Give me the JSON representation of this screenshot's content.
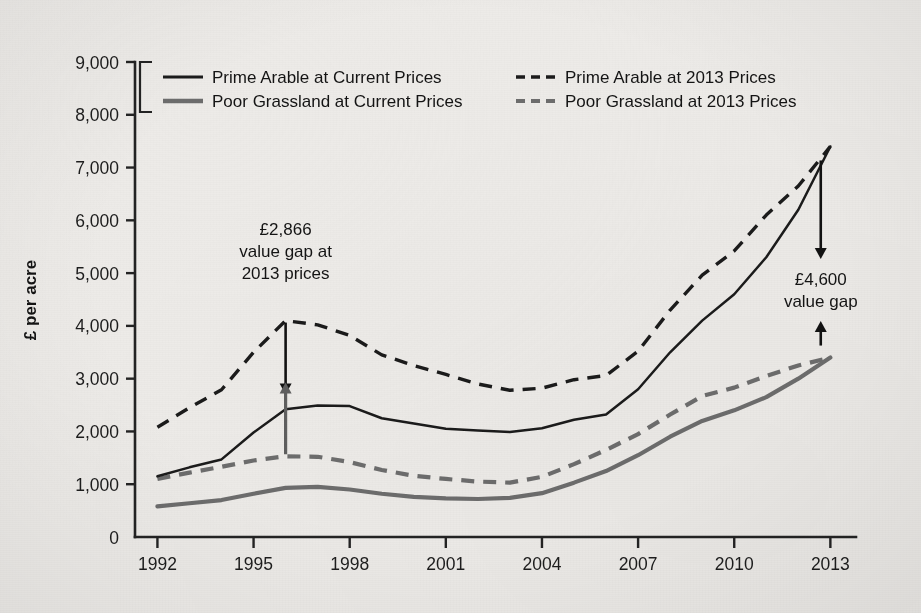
{
  "chart_data": {
    "type": "line",
    "title": "",
    "xlabel": "",
    "ylabel": "£ per acre",
    "xlim": [
      1991.3,
      2013.8
    ],
    "ylim": [
      0,
      9000
    ],
    "grid": false,
    "legend_position": "top-inside",
    "y_ticks": [
      "0",
      "1,000",
      "2,000",
      "3,000",
      "4,000",
      "5,000",
      "6,000",
      "7,000",
      "8,000",
      "9,000"
    ],
    "y_tick_values": [
      0,
      1000,
      2000,
      3000,
      4000,
      5000,
      6000,
      7000,
      8000,
      9000
    ],
    "x_ticks": [
      "1992",
      "1995",
      "1998",
      "2001",
      "2004",
      "2007",
      "2010",
      "2013"
    ],
    "x_tick_values": [
      1992,
      1995,
      1998,
      2001,
      2004,
      2007,
      2010,
      2013
    ],
    "x": [
      1992,
      1993,
      1994,
      1995,
      1996,
      1997,
      1998,
      1999,
      2000,
      2001,
      2002,
      2003,
      2004,
      2005,
      2006,
      2007,
      2008,
      2009,
      2010,
      2011,
      2012,
      2013
    ],
    "series": [
      {
        "name": "Prime Arable at Current Prices",
        "style": "solid",
        "color": "#1b1b1b",
        "values": [
          1150,
          1320,
          1470,
          1980,
          2420,
          2490,
          2480,
          2250,
          2150,
          2050,
          2020,
          1990,
          2060,
          2220,
          2320,
          2800,
          3500,
          4100,
          4600,
          5300,
          6200,
          7400
        ]
      },
      {
        "name": "Poor Grassland at Current Prices",
        "style": "solid",
        "color": "#6d6d6d",
        "values": [
          580,
          640,
          700,
          820,
          930,
          950,
          900,
          820,
          760,
          730,
          720,
          740,
          830,
          1030,
          1250,
          1550,
          1900,
          2200,
          2400,
          2650,
          3000,
          3400
        ]
      },
      {
        "name": "Prime Arable at 2013 Prices",
        "style": "dashed",
        "color": "#1b1b1b",
        "values": [
          2080,
          2450,
          2790,
          3500,
          4100,
          4020,
          3820,
          3450,
          3250,
          3080,
          2900,
          2780,
          2820,
          2980,
          3060,
          3520,
          4300,
          4960,
          5420,
          6100,
          6650,
          7400
        ]
      },
      {
        "name": "Poor Grassland at 2013 Prices",
        "style": "dashed",
        "color": "#6d6d6d",
        "values": [
          1100,
          1220,
          1330,
          1450,
          1530,
          1520,
          1420,
          1270,
          1160,
          1100,
          1050,
          1030,
          1140,
          1380,
          1650,
          1950,
          2320,
          2670,
          2830,
          3050,
          3250,
          3400
        ]
      }
    ],
    "annotations": [
      {
        "id": "gap-1996",
        "lines": [
          "£2,866",
          "value gap at",
          "2013 prices"
        ],
        "value": "£2,866",
        "year": 1996,
        "arrow_top": 4100,
        "arrow_bottom": 1530
      },
      {
        "id": "gap-2013",
        "lines": [
          "£4,600",
          "value gap"
        ],
        "value": "£4,600",
        "year": 2012.7,
        "arrow_top": 7400,
        "arrow_bottom": 3400
      }
    ]
  },
  "legend": {
    "entries": [
      {
        "label": "Prime Arable at Current Prices",
        "style": "solid",
        "color": "#1b1b1b"
      },
      {
        "label": "Prime Arable at 2013 Prices",
        "style": "dashed",
        "color": "#1b1b1b"
      },
      {
        "label": "Poor Grassland at Current Prices",
        "style": "solid",
        "color": "#6d6d6d"
      },
      {
        "label": "Poor Grassland at 2013 Prices",
        "style": "dashed",
        "color": "#6d6d6d"
      }
    ]
  },
  "axis": {
    "y_title": "£ per acre"
  }
}
